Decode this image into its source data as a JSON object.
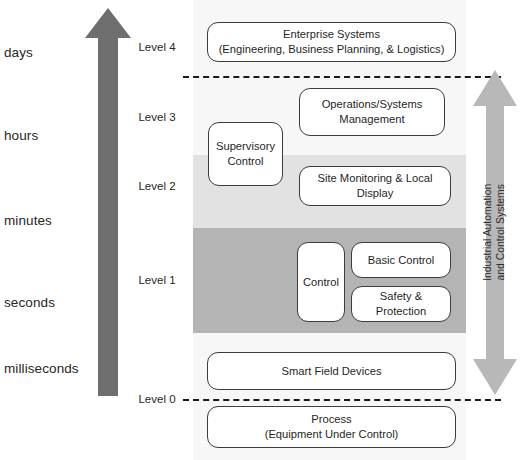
{
  "diagram": {
    "colors": {
      "arrow_gray": "#6e6e6e",
      "band_light": "#e2e2e2",
      "band_dark": "#b4b4b4",
      "panel_bg": "#f7f7f7",
      "node_border": "#3c3c3c",
      "iacs_arrow": "#b8b8b8",
      "dash_line": "#1a1a1a"
    },
    "time_axis": {
      "icon": "up-arrow-icon",
      "direction": "upward",
      "labels": [
        {
          "text": "days",
          "top": 45
        },
        {
          "text": "hours",
          "top": 128
        },
        {
          "text": "minutes",
          "top": 213
        },
        {
          "text": "seconds",
          "top": 295
        },
        {
          "text": "milliseconds",
          "top": 361
        }
      ]
    },
    "levels": [
      {
        "text": "Level 4",
        "top": 41
      },
      {
        "text": "Level 3",
        "top": 111
      },
      {
        "text": "Level 2",
        "top": 180
      },
      {
        "text": "Level 1",
        "top": 274
      },
      {
        "text": "Level 0",
        "top": 393
      }
    ],
    "bands": [
      {
        "name": "level-2-band",
        "top": 155,
        "height": 73,
        "shade": "light"
      },
      {
        "name": "level-1-band",
        "top": 228,
        "height": 105,
        "shade": "dark"
      }
    ],
    "separators": [
      {
        "name": "level-4-separator",
        "left": 183,
        "top": 76,
        "width": 318
      },
      {
        "name": "level-0-separator",
        "left": 183,
        "top": 399,
        "width": 318
      }
    ],
    "nodes": [
      {
        "name": "enterprise-systems-box",
        "line1": "Enterprise Systems",
        "line2": "(Engineering, Business Planning, & Logistics)",
        "left": 14,
        "top": 22,
        "width": 249,
        "height": 40
      },
      {
        "name": "operations-systems-management-box",
        "line1": "Operations/Systems",
        "line2": "Management",
        "left": 106,
        "top": 88,
        "width": 146,
        "height": 48
      },
      {
        "name": "supervisory-control-box",
        "line1": "Supervisory",
        "line2": "Control",
        "left": 15,
        "top": 122,
        "width": 75,
        "height": 64
      },
      {
        "name": "site-monitoring-local-display-box",
        "line1": "Site Monitoring & Local Display",
        "line2": "",
        "left": 106,
        "top": 166,
        "width": 152,
        "height": 40
      },
      {
        "name": "control-box",
        "line1": "Control",
        "line2": "",
        "left": 104,
        "top": 242,
        "width": 48,
        "height": 80
      },
      {
        "name": "basic-control-box",
        "line1": "Basic Control",
        "line2": "",
        "left": 158,
        "top": 242,
        "width": 100,
        "height": 36
      },
      {
        "name": "safety-protection-box",
        "line1": "Safety & Protection",
        "line2": "",
        "left": 158,
        "top": 286,
        "width": 100,
        "height": 36
      },
      {
        "name": "smart-field-devices-box",
        "line1": "Smart Field Devices",
        "line2": "",
        "left": 14,
        "top": 352,
        "width": 249,
        "height": 38
      },
      {
        "name": "process-box",
        "line1": "Process",
        "line2": "(Equipment Under Control)",
        "left": 14,
        "top": 406,
        "width": 249,
        "height": 42
      }
    ],
    "iacs_scope": {
      "name": "industrial-automation-control-systems-arrow",
      "icon": "double-headed-vertical-arrow-icon",
      "line1": "Industrial Automation",
      "line2": "and Control Systems"
    }
  }
}
